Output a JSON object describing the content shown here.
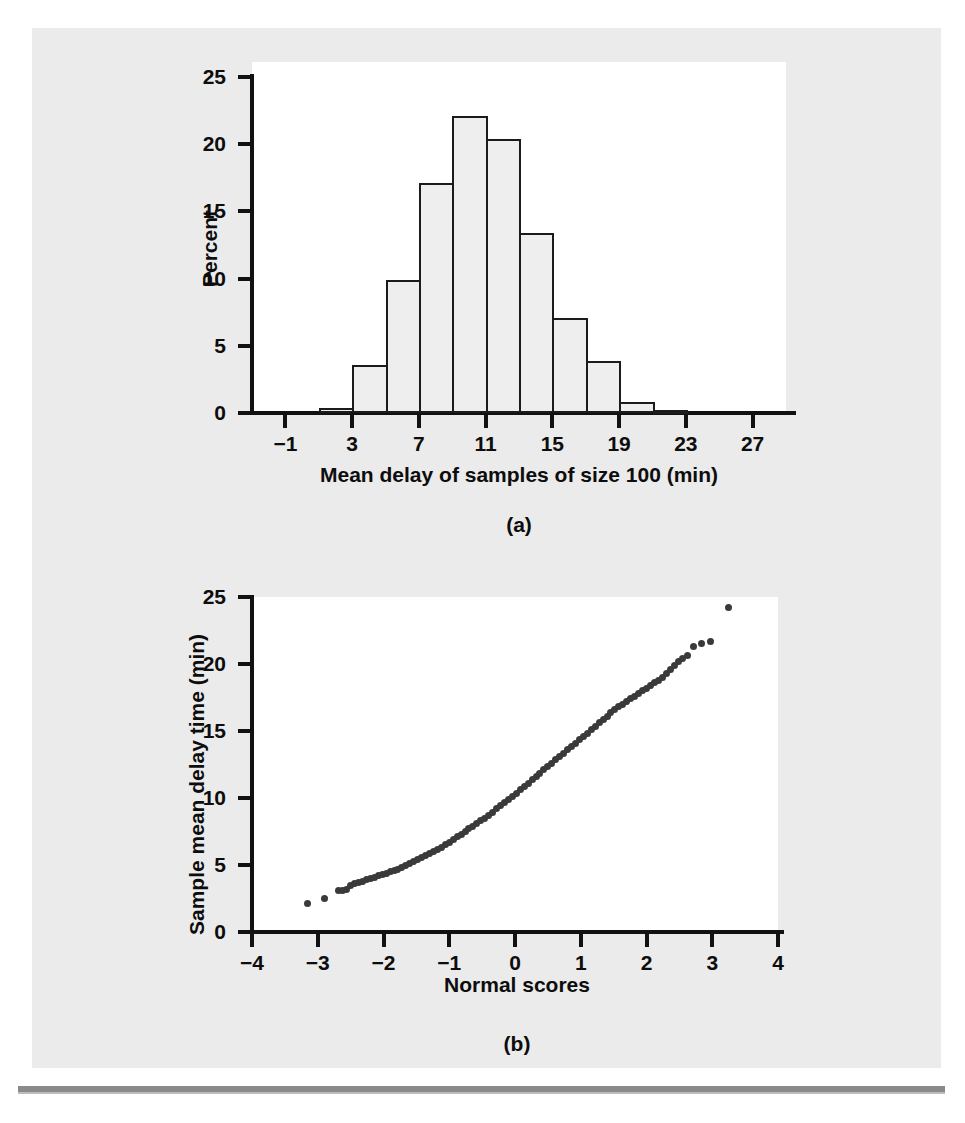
{
  "figure": {
    "panel_a_caption": "(a)",
    "panel_b_caption": "(b)"
  },
  "chart_data": [
    {
      "type": "bar",
      "panel": "(a)",
      "title": "",
      "xlabel": "Mean delay of samples of size 100 (min)",
      "ylabel": "Percent",
      "xlim": [
        -3,
        29
      ],
      "ylim": [
        0,
        25
      ],
      "xticks": [
        -1,
        3,
        7,
        11,
        15,
        19,
        23,
        27
      ],
      "yticks": [
        0,
        5,
        10,
        15,
        20,
        25
      ],
      "grid": false,
      "legend": "none",
      "bin_width": 2,
      "bin_starts": [
        1,
        3,
        5,
        7,
        9,
        11,
        13,
        15,
        17,
        19,
        21
      ],
      "categories": [
        "1-3",
        "3-5",
        "5-7",
        "7-9",
        "9-11",
        "11-13",
        "13-15",
        "15-17",
        "17-19",
        "19-21",
        "21-23"
      ],
      "values": [
        0.4,
        3.6,
        9.9,
        17.1,
        22.1,
        20.4,
        13.4,
        7.1,
        3.9,
        0.8,
        0.2
      ],
      "bar_fill": "#eeeeee",
      "bar_stroke": "#1b1b1b"
    },
    {
      "type": "scatter",
      "panel": "(b)",
      "title": "",
      "xlabel": "Normal scores",
      "ylabel": "Sample mean delay time (min)",
      "xlim": [
        -4,
        4
      ],
      "ylim": [
        0,
        25
      ],
      "xticks": [
        -4,
        -3,
        -2,
        -1,
        0,
        1,
        2,
        3,
        4
      ],
      "yticks": [
        0,
        5,
        10,
        15,
        20,
        25
      ],
      "grid": false,
      "legend": "none",
      "marker_color": "#3a3a3a",
      "points": [
        [
          -3.15,
          2.1
        ],
        [
          -2.9,
          2.5
        ],
        [
          -2.68,
          3.1
        ],
        [
          -2.62,
          3.1
        ],
        [
          -2.56,
          3.2
        ],
        [
          -2.5,
          3.5
        ],
        [
          -2.44,
          3.6
        ],
        [
          -2.38,
          3.7
        ],
        [
          -2.32,
          3.8
        ],
        [
          -2.26,
          3.9
        ],
        [
          -2.2,
          4.0
        ],
        [
          -2.14,
          4.1
        ],
        [
          -2.08,
          4.2
        ],
        [
          -2.02,
          4.3
        ],
        [
          -1.96,
          4.4
        ],
        [
          -1.9,
          4.5
        ],
        [
          -1.84,
          4.6
        ],
        [
          -1.78,
          4.7
        ],
        [
          -1.72,
          4.85
        ],
        [
          -1.66,
          5.0
        ],
        [
          -1.6,
          5.1
        ],
        [
          -1.54,
          5.25
        ],
        [
          -1.48,
          5.4
        ],
        [
          -1.42,
          5.55
        ],
        [
          -1.36,
          5.7
        ],
        [
          -1.3,
          5.85
        ],
        [
          -1.24,
          6.0
        ],
        [
          -1.18,
          6.15
        ],
        [
          -1.12,
          6.3
        ],
        [
          -1.06,
          6.5
        ],
        [
          -1.0,
          6.7
        ],
        [
          -0.94,
          6.9
        ],
        [
          -0.88,
          7.1
        ],
        [
          -0.82,
          7.3
        ],
        [
          -0.76,
          7.5
        ],
        [
          -0.7,
          7.7
        ],
        [
          -0.64,
          7.9
        ],
        [
          -0.58,
          8.1
        ],
        [
          -0.52,
          8.3
        ],
        [
          -0.46,
          8.5
        ],
        [
          -0.4,
          8.7
        ],
        [
          -0.34,
          8.95
        ],
        [
          -0.28,
          9.2
        ],
        [
          -0.22,
          9.45
        ],
        [
          -0.16,
          9.7
        ],
        [
          -0.1,
          9.9
        ],
        [
          -0.04,
          10.1
        ],
        [
          0.02,
          10.35
        ],
        [
          0.08,
          10.6
        ],
        [
          0.14,
          10.85
        ],
        [
          0.2,
          11.1
        ],
        [
          0.26,
          11.35
        ],
        [
          0.32,
          11.6
        ],
        [
          0.38,
          11.85
        ],
        [
          0.44,
          12.1
        ],
        [
          0.5,
          12.35
        ],
        [
          0.56,
          12.6
        ],
        [
          0.62,
          12.85
        ],
        [
          0.68,
          13.1
        ],
        [
          0.74,
          13.35
        ],
        [
          0.8,
          13.6
        ],
        [
          0.86,
          13.85
        ],
        [
          0.92,
          14.1
        ],
        [
          0.98,
          14.35
        ],
        [
          1.04,
          14.6
        ],
        [
          1.1,
          14.85
        ],
        [
          1.16,
          15.1
        ],
        [
          1.22,
          15.35
        ],
        [
          1.28,
          15.6
        ],
        [
          1.34,
          15.85
        ],
        [
          1.4,
          16.1
        ],
        [
          1.46,
          16.35
        ],
        [
          1.52,
          16.6
        ],
        [
          1.58,
          16.8
        ],
        [
          1.64,
          17.0
        ],
        [
          1.7,
          17.2
        ],
        [
          1.76,
          17.4
        ],
        [
          1.82,
          17.6
        ],
        [
          1.88,
          17.8
        ],
        [
          1.94,
          18.0
        ],
        [
          2.0,
          18.2
        ],
        [
          2.06,
          18.4
        ],
        [
          2.12,
          18.6
        ],
        [
          2.18,
          18.8
        ],
        [
          2.24,
          19.0
        ],
        [
          2.3,
          19.3
        ],
        [
          2.36,
          19.6
        ],
        [
          2.42,
          19.9
        ],
        [
          2.48,
          20.2
        ],
        [
          2.54,
          20.4
        ],
        [
          2.62,
          20.6
        ],
        [
          2.72,
          21.3
        ],
        [
          2.84,
          21.5
        ],
        [
          2.98,
          21.7
        ],
        [
          3.25,
          24.2
        ]
      ]
    }
  ]
}
